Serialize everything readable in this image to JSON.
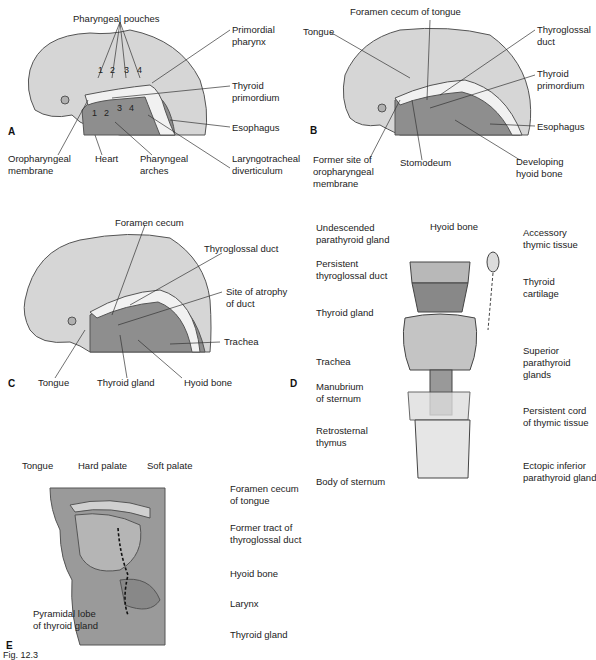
{
  "figure": {
    "caption": "Fig. 12.3",
    "panels": {
      "A": {
        "letter": "A",
        "labels": {
          "pharyngeal_pouches": "Pharyngeal pouches",
          "primordial_pharynx_1": "Primordial",
          "primordial_pharynx_2": "pharynx",
          "thyroid_primordium_1": "Thyroid",
          "thyroid_primordium_2": "primordium",
          "esophagus": "Esophagus",
          "oropharyngeal_membrane_1": "Oropharyngeal",
          "oropharyngeal_membrane_2": "membrane",
          "heart": "Heart",
          "pharyngeal_arches_1": "Pharyngeal",
          "pharyngeal_arches_2": "arches",
          "laryngotracheal_1": "Laryngotracheal",
          "laryngotracheal_2": "diverticulum"
        },
        "pouch_numbers": [
          "1",
          "2",
          "3",
          "4"
        ],
        "arch_numbers": [
          "1",
          "2",
          "3",
          "4"
        ]
      },
      "B": {
        "letter": "B",
        "labels": {
          "foramen_cecum": "Foramen cecum of tongue",
          "tongue": "Tongue",
          "thyroglossal_duct_1": "Thyroglossal",
          "thyroglossal_duct_2": "duct",
          "thyroid_primordium_1": "Thyroid",
          "thyroid_primordium_2": "primordium",
          "esophagus": "Esophagus",
          "former_site_1": "Former site of",
          "former_site_2": "oropharyngeal",
          "former_site_3": "membrane",
          "stomodeum": "Stomodeum",
          "hyoid_1": "Developing",
          "hyoid_2": "hyoid bone"
        }
      },
      "C": {
        "letter": "C",
        "labels": {
          "foramen_cecum": "Foramen cecum",
          "thyroglossal_duct": "Thyroglossal duct",
          "atrophy_1": "Site of atrophy",
          "atrophy_2": "of duct",
          "trachea": "Trachea",
          "tongue": "Tongue",
          "thyroid_gland": "Thyroid gland",
          "hyoid_bone": "Hyoid bone"
        }
      },
      "D": {
        "letter": "D",
        "labels": {
          "undescended_1": "Undescended",
          "undescended_2": "parathyroid gland",
          "hyoid_bone": "Hyoid bone",
          "accessory_1": "Accessory",
          "accessory_2": "thymic tissue",
          "persistent_duct_1": "Persistent",
          "persistent_duct_2": "thyroglossal duct",
          "thyroid_cartilage_1": "Thyroid",
          "thyroid_cartilage_2": "cartilage",
          "thyroid_gland": "Thyroid gland",
          "superior_para_1": "Superior",
          "superior_para_2": "parathyroid",
          "superior_para_3": "glands",
          "trachea": "Trachea",
          "manubrium_1": "Manubrium",
          "manubrium_2": "of sternum",
          "cord_1": "Persistent cord",
          "cord_2": "of thymic tissue",
          "retrosternal_1": "Retrosternal",
          "retrosternal_2": "thymus",
          "ectopic_1": "Ectopic inferior",
          "ectopic_2": "parathyroid gland",
          "body_sternum": "Body of sternum"
        }
      },
      "E": {
        "letter": "E",
        "labels": {
          "tongue": "Tongue",
          "hard_palate": "Hard palate",
          "soft_palate": "Soft palate",
          "foramen_1": "Foramen cecum",
          "foramen_2": "of tongue",
          "former_tract_1": "Former tract of",
          "former_tract_2": "thyroglossal duct",
          "hyoid_bone": "Hyoid bone",
          "larynx": "Larynx",
          "pyramidal_1": "Pyramidal lobe",
          "pyramidal_2": "of thyroid gland",
          "thyroid_gland": "Thyroid gland"
        }
      }
    },
    "colors": {
      "head_light": "#d9d9d9",
      "tissue_dark": "#8a8a8a",
      "tissue_mid": "#a9a9a9",
      "cavity": "#f2f2f2",
      "outline": "#444444",
      "leader": "#333333"
    }
  }
}
